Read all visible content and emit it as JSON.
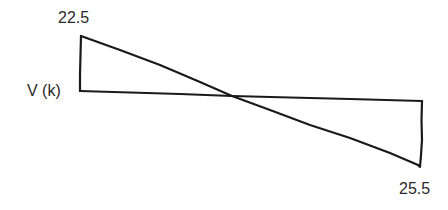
{
  "diagram": {
    "type": "shear-force-diagram",
    "axis_label": "V (k)",
    "max_positive_label": "22.5",
    "max_negative_label": "25.5",
    "values": {
      "left_end_shear": 22.5,
      "right_end_shear": -25.5
    },
    "stroke_color": "#1a1a1a",
    "text_color": "#2a2a2a"
  }
}
